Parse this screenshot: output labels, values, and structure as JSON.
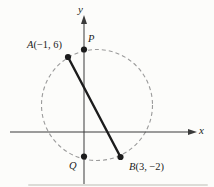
{
  "figure": {
    "description_visible_text_only": "",
    "axes": {
      "x_label": "x",
      "y_label": "y"
    },
    "points": {
      "A": {
        "letter": "A",
        "coords": "(−1, 6)",
        "x": -1,
        "y": 6
      },
      "B": {
        "letter": "B",
        "coords": "(3, −2)",
        "x": 3,
        "y": -2
      },
      "P": {
        "letter": "P",
        "coords": ""
      },
      "Q": {
        "letter": "Q",
        "coords": ""
      }
    },
    "circle": {
      "style": "dashed",
      "passes_through": [
        "A",
        "P",
        "B",
        "Q"
      ]
    },
    "segment": {
      "from": "A",
      "to": "B"
    },
    "colors": {
      "ink": "#1c1c1c",
      "axis": "#3a3a3a",
      "dash": "#9b9b9b",
      "background": "#fcfcfa"
    }
  }
}
